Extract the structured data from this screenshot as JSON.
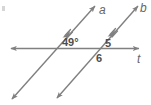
{
  "figure": {
    "type": "geometry-diagram",
    "background_color": "#ffffff",
    "stroke_color": "#808080",
    "text_color": "#4d4d4d"
  },
  "lines": {
    "line_a": {
      "label": "a",
      "role": "parallel-line",
      "parallel_tick_marks": 1,
      "direction": "lower-left to upper-right",
      "arrowheads": "both-ends"
    },
    "line_b": {
      "label": "b",
      "role": "parallel-line",
      "parallel_tick_marks": 1,
      "direction": "lower-left to upper-right",
      "arrowheads": "both-ends"
    },
    "line_t": {
      "label": "t",
      "role": "transversal",
      "direction": "horizontal",
      "arrowheads": "both-ends"
    }
  },
  "angles": [
    {
      "name": "angle-49",
      "label": "49°",
      "value": 49,
      "unit": "degrees",
      "position": "above transversal, right of line a intersection"
    },
    {
      "name": "angle-5",
      "label": "5",
      "value": 5,
      "unit": "angle-number",
      "position": "above transversal, right of line b intersection"
    },
    {
      "name": "angle-6",
      "label": "6",
      "value": 6,
      "unit": "angle-number",
      "position": "below transversal, right of line b intersection"
    }
  ]
}
